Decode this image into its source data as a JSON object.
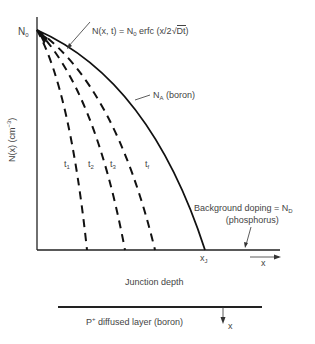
{
  "diagram": {
    "axes": {
      "y_label": "N(x) (cm",
      "y_label_exp": "−3",
      "y_label_close": ")",
      "origin_label": "N",
      "origin_label_sub": "0",
      "x_end_label": "x",
      "x_end_label_sub": "J",
      "x_arrow_label": "x"
    },
    "formula": {
      "lhs": "N(x, t) = N",
      "sub": "0",
      "rhs": " erfc (x/2",
      "sqrt_arg": "Dt",
      "close": ")"
    },
    "curve_label": {
      "text": "N",
      "sub": "A",
      "suffix": " (boron)"
    },
    "time_labels": [
      {
        "t": "t",
        "sub": "1"
      },
      {
        "t": "t",
        "sub": "2"
      },
      {
        "t": "t",
        "sub": "3"
      },
      {
        "t": "t",
        "sub": "f"
      }
    ],
    "background": {
      "line1": "Background doping = N",
      "line1_sub": "D",
      "line2": "(phosphorus)"
    },
    "junction_label": "Junction depth",
    "layer": {
      "label_prefix": "P",
      "label_sup": "+",
      "label_rest": " diffused layer (boron)",
      "arrow_label": "x"
    }
  }
}
